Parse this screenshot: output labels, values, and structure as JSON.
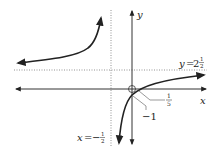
{
  "figure": {
    "type": "rational-function-graph",
    "axes": {
      "x_label": "x",
      "y_label": "y"
    },
    "asymptotes": {
      "horizontal": {
        "label_var": "y",
        "label_eq": "=",
        "label_whole": "2",
        "label_num": "1",
        "label_den": "2"
      },
      "vertical": {
        "label_var": "x",
        "label_eq": "=",
        "label_sign": "−",
        "label_num": "1",
        "label_den": "2"
      }
    },
    "intercepts": {
      "x_intercept": {
        "num": "1",
        "den": "5"
      },
      "y_intercept": {
        "value": "−1"
      }
    },
    "colors": {
      "curve": "#222222",
      "axis": "#333333",
      "asymptote": "#777777"
    }
  }
}
